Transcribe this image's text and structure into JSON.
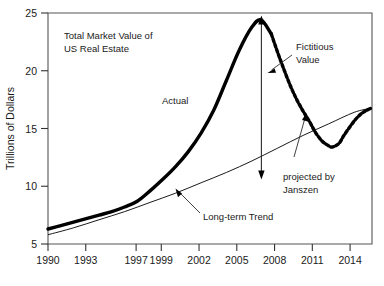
{
  "chart_data": {
    "type": "line",
    "title": "",
    "xlabel": "",
    "ylabel": "Trillions of Dollars",
    "xlim": [
      1990,
      2015.4
    ],
    "ylim": [
      5,
      25
    ],
    "grid": false,
    "legend": "none",
    "x_ticks": [
      1990,
      1993,
      1997,
      1999,
      2002,
      2005,
      2008,
      2011,
      2014
    ],
    "x_tick_labels": [
      "1990",
      "1993",
      "1997",
      "1999",
      "2002",
      "2005",
      "2008",
      "2011",
      "2014"
    ],
    "y_ticks": [
      5,
      10,
      15,
      20,
      25
    ],
    "y_tick_labels": [
      "5",
      "10",
      "15",
      "20",
      "25"
    ],
    "series": [
      {
        "name": "Actual",
        "style": "thick-solid",
        "color": "#000000",
        "x": [
          1990,
          1991,
          1992,
          1993,
          1994,
          1995,
          1996,
          1997,
          1998,
          1999,
          2000,
          2001,
          2002,
          2003,
          2004,
          2005,
          2006,
          2006.7,
          2007.5
        ],
        "values": [
          6.3,
          6.6,
          6.9,
          7.2,
          7.5,
          7.8,
          8.2,
          8.7,
          9.6,
          10.6,
          11.7,
          13.0,
          14.6,
          16.6,
          19.2,
          21.8,
          23.8,
          24.4,
          23.2
        ]
      },
      {
        "name": "Fictitious Value / projected by Janszen",
        "style": "thick-dashed",
        "color": "#000000",
        "x": [
          2007.5,
          2008,
          2008.5,
          2009,
          2009.5,
          2010,
          2010.5,
          2011,
          2011.5,
          2012,
          2012.3,
          2012.8,
          2013.2,
          2013.7,
          2014.2,
          2014.7,
          2015.3
        ],
        "values": [
          23.2,
          21.6,
          20.1,
          18.7,
          17.5,
          16.5,
          15.6,
          14.6,
          13.9,
          13.5,
          13.4,
          13.7,
          14.4,
          15.2,
          15.9,
          16.4,
          16.75
        ]
      },
      {
        "name": "Long-term Trend",
        "style": "thin-solid",
        "color": "#000000",
        "x": [
          1990,
          1992,
          1994,
          1996,
          1998,
          2000,
          2002,
          2004,
          2006,
          2008,
          2010,
          2012,
          2014,
          2015.3
        ],
        "values": [
          5.8,
          6.4,
          7.1,
          7.8,
          8.6,
          9.4,
          10.3,
          11.2,
          12.2,
          13.3,
          14.4,
          15.4,
          16.4,
          16.75
        ]
      }
    ],
    "annotations": [
      {
        "name": "chart-title-annotation",
        "text_line1": "Total Market Value of",
        "text_line2": "US Real Estate"
      },
      {
        "name": "actual-label",
        "text": "Actual"
      },
      {
        "name": "fictitious-value-label",
        "text_line1": "Fictitious",
        "text_line2": "Value"
      },
      {
        "name": "projected-by-janszen-label",
        "text_line1": "projected by",
        "text_line2": "Janszen"
      },
      {
        "name": "long-term-trend-label",
        "text": "Long-term Trend"
      },
      {
        "name": "fictitious-value-span-arrow",
        "from_value": 24.4,
        "to_value": 11.8,
        "at_x": 2006.7
      }
    ]
  }
}
